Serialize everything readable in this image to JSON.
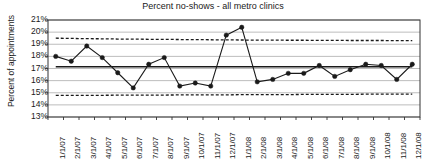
{
  "chart_data": {
    "type": "line",
    "title": "Percent no-shows - all metro clinics",
    "xlabel": "",
    "ylabel": "Percent of appointments",
    "ylim": [
      13,
      21
    ],
    "ytick_labels": [
      "21%",
      "20%",
      "19%",
      "18%",
      "17%",
      "16%",
      "15%",
      "14%",
      "13%"
    ],
    "ytick_values": [
      21,
      20,
      19,
      18,
      17,
      16,
      15,
      14,
      13
    ],
    "grid": true,
    "legend": "none",
    "categories": [
      "1/1/07",
      "2/1/07",
      "3/1/07",
      "4/1/07",
      "5/1/07",
      "6/1/07",
      "7/1/07",
      "8/1/07",
      "9/1/07",
      "10/1/07",
      "11/1/07",
      "12/1/07",
      "1/1/08",
      "2/1/08",
      "3/1/08",
      "4/1/08",
      "5/1/08",
      "6/1/08",
      "7/1/08",
      "8/1/08",
      "9/1/08",
      "10/1/08",
      "11/1/08",
      "12/1/08"
    ],
    "series": [
      {
        "name": "Percent no-shows",
        "style": "solid-marker",
        "values": [
          18.0,
          17.6,
          18.85,
          17.9,
          16.65,
          15.4,
          17.35,
          17.9,
          15.55,
          15.8,
          15.55,
          19.75,
          20.4,
          15.9,
          16.1,
          16.6,
          16.6,
          17.25,
          16.35,
          16.9,
          17.35,
          17.25,
          16.1,
          17.35
        ]
      },
      {
        "name": "Center line",
        "style": "solid",
        "values": [
          17.15,
          17.15,
          17.15,
          17.15,
          17.15,
          17.15,
          17.15,
          17.15,
          17.15,
          17.15,
          17.15,
          17.15,
          17.15,
          17.15,
          17.15,
          17.15,
          17.15,
          17.15,
          17.15,
          17.15,
          17.15,
          17.15,
          17.15,
          17.15
        ]
      },
      {
        "name": "Upper control limit",
        "style": "dashed",
        "values": [
          19.5,
          19.48,
          19.46,
          19.45,
          19.43,
          19.42,
          19.41,
          19.4,
          19.39,
          19.38,
          19.37,
          19.36,
          19.35,
          19.34,
          19.34,
          19.33,
          19.33,
          19.32,
          19.32,
          19.31,
          19.31,
          19.31,
          19.3,
          19.3
        ]
      },
      {
        "name": "Lower control limit",
        "style": "dashed",
        "values": [
          14.78,
          14.78,
          14.79,
          14.79,
          14.8,
          14.8,
          14.81,
          14.81,
          14.82,
          14.82,
          14.83,
          14.83,
          14.84,
          14.84,
          14.85,
          14.85,
          14.86,
          14.86,
          14.87,
          14.87,
          14.88,
          14.88,
          14.88,
          14.88
        ]
      }
    ],
    "colors": {
      "line": "#1a1a1a",
      "marker": "#1a1a1a",
      "grid": "#b5b5b5",
      "axis": "#333333",
      "center_line": "#1a1a1a",
      "control_limit": "#1a1a1a",
      "background": "#ffffff"
    }
  }
}
